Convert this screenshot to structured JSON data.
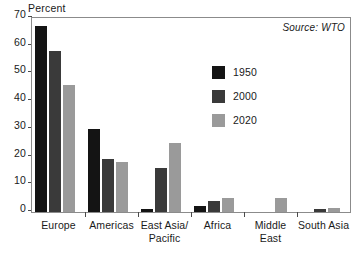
{
  "chart_data": {
    "type": "bar",
    "title": "",
    "subtitle": "",
    "xlabel": "",
    "ylabel": "Percent",
    "ylim": [
      0,
      70
    ],
    "yticks": [
      0,
      10,
      20,
      30,
      40,
      50,
      60,
      70
    ],
    "ytick_labels": [
      "0",
      "10",
      "20",
      "30",
      "40",
      "50",
      "60",
      "70"
    ],
    "grid": false,
    "legend_position": "inside-upper-right",
    "annotations": [
      {
        "name": "source",
        "text": "Source: WTO"
      }
    ],
    "categories": [
      "Europe",
      "Americas",
      "East Asia/\nPacific",
      "Africa",
      "Middle\nEast",
      "South Asia"
    ],
    "category_lines": [
      [
        "Europe",
        ""
      ],
      [
        "Americas",
        ""
      ],
      [
        "East Asia/",
        "Pacific"
      ],
      [
        "Africa",
        ""
      ],
      [
        "Middle",
        "East"
      ],
      [
        "South Asia",
        ""
      ]
    ],
    "series": [
      {
        "name": "1950",
        "color": "#141414",
        "values": [
          67,
          30,
          1,
          2,
          0,
          0
        ]
      },
      {
        "name": "2000",
        "color": "#3a3a3a",
        "values": [
          58,
          19,
          16,
          4,
          0,
          1
        ]
      },
      {
        "name": "2020",
        "color": "#9a9a9a",
        "values": [
          46,
          18,
          25,
          5,
          5,
          1.5
        ]
      }
    ]
  },
  "legend": {
    "items": [
      {
        "label": "1950",
        "color": "#141414"
      },
      {
        "label": "2000",
        "color": "#3a3a3a"
      },
      {
        "label": "2020",
        "color": "#9a9a9a"
      }
    ]
  },
  "colors": {
    "axis": "#8b8b8b",
    "tick": "#4a4a4a",
    "text": "#1a1a1a",
    "background": "#ffffff"
  }
}
